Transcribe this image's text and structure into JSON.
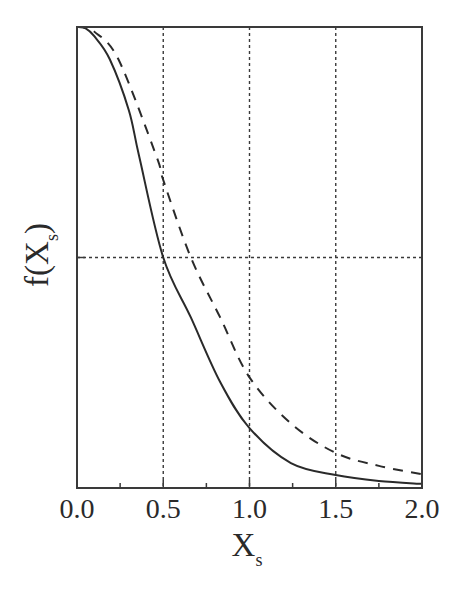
{
  "chart_data": {
    "type": "line",
    "title": "",
    "xlabel": "X",
    "xlabel_subscript": "s",
    "ylabel": "f(X",
    "ylabel_subscript": "s",
    "ylabel_close": ")",
    "xlim": [
      0.0,
      2.0
    ],
    "ylim": [
      0.0,
      1.0
    ],
    "x_ticks": [
      0.0,
      0.5,
      1.0,
      1.5,
      2.0
    ],
    "x_tick_labels": [
      "0.0",
      "0.5",
      "1.0",
      "1.5",
      "2.0"
    ],
    "x_minor_ticks": [
      0.25,
      0.75,
      1.25,
      1.75
    ],
    "y_ticks": [
      0.5
    ],
    "y_tick_labels": [],
    "grid": {
      "style": "dotted",
      "vertical": [
        0.5,
        1.0,
        1.5
      ],
      "horizontal": [
        0.5
      ]
    },
    "legend": null,
    "series": [
      {
        "name": "solid",
        "style": "solid",
        "color": "#2a2a2a",
        "x": [
          0.0,
          0.05,
          0.1,
          0.19,
          0.3,
          0.36,
          0.5,
          0.66,
          0.83,
          1.0,
          1.24,
          1.5,
          1.75,
          2.0
        ],
        "y": [
          1.0,
          0.997,
          0.98,
          0.93,
          0.82,
          0.72,
          0.5,
          0.37,
          0.23,
          0.13,
          0.054,
          0.028,
          0.015,
          0.009
        ]
      },
      {
        "name": "dashed",
        "style": "dashed",
        "color": "#2a2a2a",
        "x": [
          0.0,
          0.05,
          0.1,
          0.24,
          0.46,
          0.5,
          0.66,
          0.83,
          1.0,
          1.24,
          1.5,
          1.75,
          2.0
        ],
        "y": [
          1.0,
          0.998,
          0.99,
          0.93,
          0.72,
          0.668,
          0.5,
          0.37,
          0.24,
          0.14,
          0.076,
          0.048,
          0.03
        ]
      }
    ]
  },
  "colors": {
    "axis": "#3a3a3a",
    "grid": "#3a3a3a",
    "background": "#ffffff"
  }
}
